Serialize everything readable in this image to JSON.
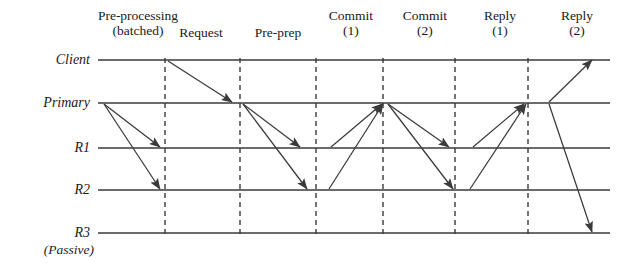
{
  "diagram": {
    "type": "sequence-timeline",
    "colors": {
      "line": "#3a3a3a",
      "arrow": "#3a3a3a",
      "dashed": "#3a3a3a",
      "text": "#1a1a1a",
      "background": "#ffffff"
    },
    "timeline_x": {
      "start": 98,
      "end": 610
    },
    "participants": [
      {
        "id": "client",
        "label": "Client",
        "sublabel": "",
        "y": 60,
        "label_x": 90
      },
      {
        "id": "primary",
        "label": "Primary",
        "sublabel": "",
        "y": 103,
        "label_x": 90
      },
      {
        "id": "r1",
        "label": "R1",
        "sublabel": "",
        "y": 148,
        "label_x": 90
      },
      {
        "id": "r2",
        "label": "R2",
        "sublabel": "",
        "y": 190,
        "label_x": 90
      },
      {
        "id": "r3",
        "label": "R3",
        "sublabel": "(Passive)",
        "y": 233,
        "label_x": 90
      }
    ],
    "phases": [
      {
        "id": "pre-processing",
        "line1": "Pre-processing",
        "line2": "(batched)",
        "label_x": 138,
        "label_y": 8
      },
      {
        "id": "request",
        "line1": "Request",
        "line2": "",
        "label_x": 201,
        "label_y": 25
      },
      {
        "id": "pre-prep",
        "line1": "Pre-prep",
        "line2": "",
        "label_x": 278,
        "label_y": 25
      },
      {
        "id": "commit-1",
        "line1": "Commit",
        "line2": "(1)",
        "label_x": 351,
        "label_y": 8
      },
      {
        "id": "commit-2",
        "line1": "Commit",
        "line2": "(2)",
        "label_x": 425,
        "label_y": 8
      },
      {
        "id": "reply-1",
        "line1": "Reply",
        "line2": "(1)",
        "label_x": 500,
        "label_y": 8
      },
      {
        "id": "reply-2",
        "line1": "Reply",
        "line2": "(2)",
        "label_x": 577,
        "label_y": 8
      }
    ],
    "dividers": [
      {
        "id": "divider-1",
        "x": 165,
        "y1": 58,
        "y2": 238
      },
      {
        "id": "divider-2",
        "x": 240,
        "y1": 58,
        "y2": 238
      },
      {
        "id": "divider-3",
        "x": 316,
        "y1": 58,
        "y2": 238
      },
      {
        "id": "divider-4",
        "x": 383,
        "y1": 58,
        "y2": 238
      },
      {
        "id": "divider-5",
        "x": 455,
        "y1": 58,
        "y2": 238
      },
      {
        "id": "divider-6",
        "x": 528,
        "y1": 58,
        "y2": 238
      }
    ],
    "messages": [
      {
        "id": "preproc-primary-r1",
        "phase": "pre-processing",
        "from": "primary",
        "to": "r1",
        "x1": 104,
        "y1": 104,
        "x2": 160,
        "y2": 147
      },
      {
        "id": "preproc-primary-r2",
        "phase": "pre-processing",
        "from": "primary",
        "to": "r2",
        "x1": 104,
        "y1": 104,
        "x2": 160,
        "y2": 189
      },
      {
        "id": "request-client-primary",
        "phase": "request",
        "from": "client",
        "to": "primary",
        "x1": 168,
        "y1": 61,
        "x2": 232,
        "y2": 102
      },
      {
        "id": "preprep-primary-r1",
        "phase": "pre-prep",
        "from": "primary",
        "to": "r1",
        "x1": 243,
        "y1": 104,
        "x2": 300,
        "y2": 147
      },
      {
        "id": "preprep-primary-r2",
        "phase": "pre-prep",
        "from": "primary",
        "to": "r2",
        "x1": 243,
        "y1": 104,
        "x2": 307,
        "y2": 189
      },
      {
        "id": "commit1-r1-primary",
        "phase": "commit-1",
        "from": "r1",
        "to": "primary",
        "x1": 331,
        "y1": 147,
        "x2": 382,
        "y2": 104
      },
      {
        "id": "commit1-r2-primary",
        "phase": "commit-1",
        "from": "r2",
        "to": "primary",
        "x1": 329,
        "y1": 189,
        "x2": 383,
        "y2": 104
      },
      {
        "id": "commit2-primary-r1",
        "phase": "commit-2",
        "from": "primary",
        "to": "r1",
        "x1": 388,
        "y1": 104,
        "x2": 449,
        "y2": 147
      },
      {
        "id": "commit2-primary-r2",
        "phase": "commit-2",
        "from": "primary",
        "to": "r2",
        "x1": 388,
        "y1": 104,
        "x2": 453,
        "y2": 189
      },
      {
        "id": "reply1-r1-primary",
        "phase": "reply-1",
        "from": "r1",
        "to": "primary",
        "x1": 473,
        "y1": 147,
        "x2": 524,
        "y2": 104
      },
      {
        "id": "reply1-r2-primary",
        "phase": "reply-1",
        "from": "r2",
        "to": "primary",
        "x1": 470,
        "y1": 189,
        "x2": 526,
        "y2": 104
      },
      {
        "id": "reply2-primary-client",
        "phase": "reply-2",
        "from": "primary",
        "to": "client",
        "x1": 549,
        "y1": 102,
        "x2": 592,
        "y2": 60
      },
      {
        "id": "reply2-primary-r3",
        "phase": "reply-2",
        "from": "primary",
        "to": "r3",
        "x1": 549,
        "y1": 104,
        "x2": 592,
        "y2": 232
      }
    ]
  }
}
